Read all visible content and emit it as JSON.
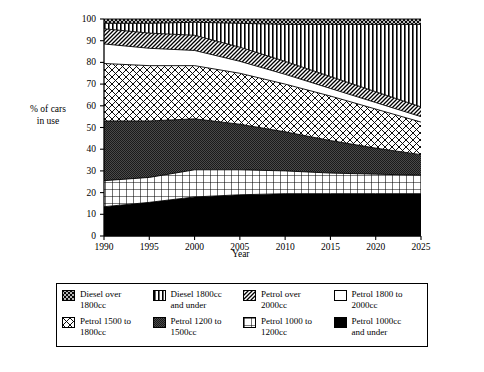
{
  "chart_data": {
    "type": "area",
    "title": "",
    "xlabel": "Year",
    "ylabel": "% of cars in use",
    "xlim": [
      1990,
      2025
    ],
    "ylim": [
      0,
      100
    ],
    "grid": false,
    "legend_position": "bottom",
    "stacked": true,
    "x": [
      1990,
      1995,
      2000,
      2005,
      2010,
      2015,
      2020,
      2025
    ],
    "x_tick_labels": [
      "1990",
      "1995",
      "2000",
      "2005",
      "2010",
      "2015",
      "2020",
      "2025"
    ],
    "y_tick_labels": [
      "0",
      "10",
      "20",
      "30",
      "40",
      "50",
      "60",
      "70",
      "80",
      "90",
      "100"
    ],
    "y_ticks": [
      0,
      10,
      20,
      30,
      40,
      50,
      60,
      70,
      80,
      90,
      100
    ],
    "series": [
      {
        "name": "Petrol 1000cc and under",
        "pattern": "solid-black",
        "values": [
          13.5,
          15.5,
          18.0,
          19.0,
          19.5,
          19.5,
          19.5,
          19.5
        ]
      },
      {
        "name": "Petrol 1000 to 1200cc",
        "pattern": "square-grid",
        "values": [
          12.0,
          11.5,
          12.5,
          11.5,
          10.5,
          9.5,
          9.0,
          8.5
        ]
      },
      {
        "name": "Petrol 1200 to 1500cc",
        "pattern": "dense-stipple",
        "values": [
          27.5,
          26.0,
          23.5,
          21.0,
          18.0,
          15.0,
          12.0,
          9.5
        ]
      },
      {
        "name": "Petrol 1500 to 1800cc",
        "pattern": "diagonal-crosshatch-light",
        "values": [
          26.5,
          25.5,
          24.5,
          23.5,
          22.0,
          20.5,
          18.0,
          15.0
        ]
      },
      {
        "name": "Petrol 1800 to 2000cc",
        "pattern": "blank-white",
        "values": [
          9.0,
          8.0,
          7.0,
          5.5,
          4.5,
          3.5,
          3.0,
          2.5
        ]
      },
      {
        "name": "Petrol over 2000cc",
        "pattern": "diagonal-hatch",
        "values": [
          7.0,
          7.0,
          7.0,
          6.5,
          6.0,
          5.5,
          5.0,
          4.5
        ]
      },
      {
        "name": "Diesel 1800cc and under",
        "pattern": "vertical-stripes",
        "values": [
          2.5,
          4.5,
          6.0,
          11.0,
          17.0,
          24.0,
          31.0,
          38.0
        ]
      },
      {
        "name": "Diesel over 1800cc",
        "pattern": "dense-diagonal-crosshatch",
        "values": [
          2.0,
          2.0,
          1.5,
          2.0,
          2.5,
          2.5,
          2.5,
          2.5
        ]
      }
    ]
  },
  "axes": {
    "y_title_line1": "% of cars",
    "y_title_line2": "in use",
    "x_title": "Year",
    "y_ticks": [
      "100",
      "90",
      "80",
      "70",
      "60",
      "50",
      "40",
      "30",
      "20",
      "10",
      "0"
    ],
    "x_ticks": [
      "1990",
      "1995",
      "2000",
      "2005",
      "2010",
      "2015",
      "2020",
      "2025"
    ]
  },
  "legend": {
    "items": [
      {
        "label_line1": "Diesel over",
        "label_line2": "1800cc",
        "swatch": "dense-diagonal-crosshatch-swatch"
      },
      {
        "label_line1": "Diesel 1800cc",
        "label_line2": "and under",
        "swatch": "vertical-stripes-swatch"
      },
      {
        "label_line1": "Petrol over",
        "label_line2": "2000cc",
        "swatch": "diagonal-hatch-swatch"
      },
      {
        "label_line1": "Petrol 1800 to",
        "label_line2": "2000cc",
        "swatch": "blank-white-swatch"
      },
      {
        "label_line1": "Petrol 1500 to",
        "label_line2": "1800cc",
        "swatch": "diagonal-crosshatch-swatch"
      },
      {
        "label_line1": "Petrol 1200 to",
        "label_line2": "1500cc",
        "swatch": "dense-stipple-swatch"
      },
      {
        "label_line1": "Petrol 1000 to",
        "label_line2": "1200cc",
        "swatch": "square-grid-swatch"
      },
      {
        "label_line1": "Petrol 1000cc",
        "label_line2": "and under",
        "swatch": "solid-black-swatch"
      }
    ]
  },
  "colors": {
    "axis": "#000000",
    "background": "#ffffff",
    "ink": "#000000",
    "band_fill_light": "#ffffff",
    "band_fill_dark": "#3a3a3a"
  }
}
